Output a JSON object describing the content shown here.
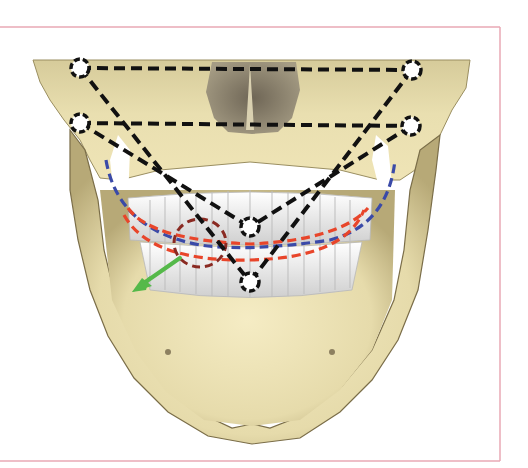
{
  "figure": {
    "description": "Frontal view of skull (maxilla and mandible) with dashed landmark triangles and dental arch curves",
    "frame_color": "#e8a9b4",
    "background": "#ffffff"
  },
  "colors": {
    "bone_light": "#efe6b8",
    "bone_mid": "#d8cc96",
    "bone_shadow": "#a89a68",
    "bone_dark": "#6e6245",
    "teeth": "#f2f2f2",
    "teeth_shadow": "#c9c9c9",
    "landmark_lines": "#111111",
    "upper_arch": "#e8452a",
    "occlusal_arch": "#3a4aa8",
    "lower_arch": "#e8452a",
    "deviation_circle": "#8a2a22",
    "direction_arrow": "#55b94a"
  },
  "landmarks": [
    {
      "id": "top-left",
      "x": 80,
      "y": 68
    },
    {
      "id": "top-right",
      "x": 412,
      "y": 70
    },
    {
      "id": "mid-left",
      "x": 80,
      "y": 123
    },
    {
      "id": "mid-right",
      "x": 411,
      "y": 126
    },
    {
      "id": "upper-incisor",
      "x": 250,
      "y": 227
    },
    {
      "id": "lower-incisor",
      "x": 250,
      "y": 282
    }
  ],
  "lines": [
    {
      "from": "top-left",
      "to": "top-right"
    },
    {
      "from": "mid-left",
      "to": "mid-right"
    },
    {
      "from": "top-left",
      "to": "lower-incisor"
    },
    {
      "from": "top-right",
      "to": "lower-incisor"
    },
    {
      "from": "mid-left",
      "to": "upper-incisor"
    },
    {
      "from": "mid-right",
      "to": "upper-incisor"
    }
  ],
  "annotations": {
    "deviation_circle_label": "",
    "arrow_label": ""
  }
}
